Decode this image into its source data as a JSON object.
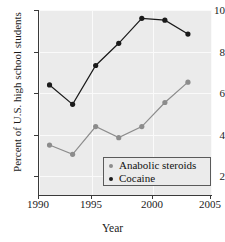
{
  "chart_data": {
    "type": "line",
    "title": "",
    "xlabel": "Year",
    "ylabel": "Percent of U.S. high school students",
    "x": [
      1991,
      1993,
      1995,
      1997,
      1999,
      2001,
      2003
    ],
    "xlim": [
      1990,
      2005
    ],
    "ylim": [
      0,
      10
    ],
    "xticks": [
      1990,
      1995,
      2000,
      2005
    ],
    "xtick_labels": [
      "1990",
      "1995",
      "2000",
      "2005"
    ],
    "yticks": [
      2,
      4,
      6,
      8,
      10
    ],
    "ytick_labels": [
      "2",
      "4",
      "6",
      "8",
      "10"
    ],
    "grid": true,
    "legend_position": "lower right",
    "series": [
      {
        "name": "Anabolic steroids",
        "color": "#8c8c8c",
        "marker": "circle",
        "values": [
          2.7,
          2.2,
          3.7,
          3.1,
          3.7,
          5.0,
          6.1
        ]
      },
      {
        "name": "Cocaine",
        "color": "#1a1a1a",
        "marker": "circle",
        "values": [
          5.95,
          4.9,
          7.0,
          8.2,
          9.55,
          9.45,
          8.7
        ]
      }
    ]
  },
  "legend": {
    "items": [
      {
        "label": "Anabolic steroids",
        "color": "#8c8c8c"
      },
      {
        "label": "Cocaine",
        "color": "#1a1a1a"
      }
    ]
  },
  "style": {
    "plot_background": "#ebebeb",
    "grid_color": "#fafafa",
    "axis_color": "#3a3a3a",
    "page_background": "#ffffff"
  }
}
